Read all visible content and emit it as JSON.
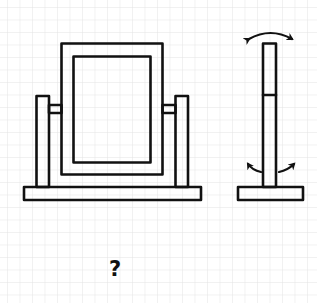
{
  "figure": {
    "colors": {
      "background": "#ffffff",
      "grid": "#e6e6e6",
      "ink": "#111111"
    },
    "grid": {
      "spacing_px": 12.5,
      "offset_px": 7
    },
    "views": [
      {
        "name": "front-view",
        "label": ""
      },
      {
        "name": "side-view",
        "label": ""
      }
    ],
    "annotations": {
      "top_arrow": "double-headed curved arrow (tilt)",
      "bottom_arrows": "two outward curved arrows (rotation)"
    },
    "question_mark": "?"
  }
}
